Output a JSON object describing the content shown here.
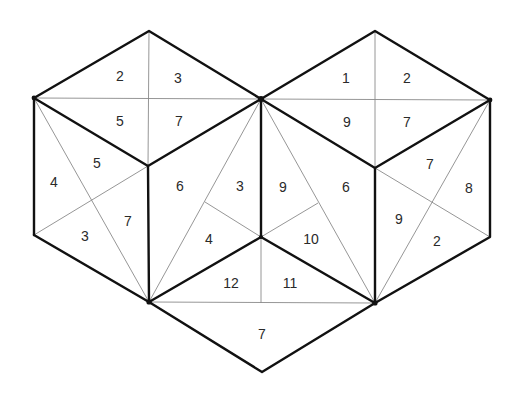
{
  "diagram": {
    "title": "",
    "labels": {
      "left_top_face": [
        "2",
        "3",
        "5",
        "7"
      ],
      "left_front_face": [
        "5",
        "4",
        "7",
        "3"
      ],
      "left_right_face": [
        "6",
        "3",
        "4"
      ],
      "right_top_face": [
        "1",
        "2",
        "9",
        "7"
      ],
      "right_left_face": [
        "9",
        "6",
        "10"
      ],
      "right_front_face": [
        "7",
        "8",
        "9",
        "2"
      ],
      "bottom_center": [
        "12",
        "11"
      ],
      "bottom_rhombus": [
        "7"
      ]
    },
    "regions": [
      {
        "id": "lt-1",
        "label": "2",
        "x": 120,
        "y": 76
      },
      {
        "id": "lt-2",
        "label": "3",
        "x": 178,
        "y": 78
      },
      {
        "id": "lt-3",
        "label": "5",
        "x": 120,
        "y": 121
      },
      {
        "id": "lt-4",
        "label": "7",
        "x": 179,
        "y": 121
      },
      {
        "id": "lf-1",
        "label": "5",
        "x": 97,
        "y": 163
      },
      {
        "id": "lf-2",
        "label": "4",
        "x": 54,
        "y": 182
      },
      {
        "id": "lf-3",
        "label": "7",
        "x": 128,
        "y": 221
      },
      {
        "id": "lf-4",
        "label": "3",
        "x": 85,
        "y": 236
      },
      {
        "id": "mf-1",
        "label": "6",
        "x": 180,
        "y": 186
      },
      {
        "id": "mf-2",
        "label": "3",
        "x": 240,
        "y": 186
      },
      {
        "id": "mf-3",
        "label": "4",
        "x": 209,
        "y": 239
      },
      {
        "id": "rt-1",
        "label": "1",
        "x": 346,
        "y": 78
      },
      {
        "id": "rt-2",
        "label": "2",
        "x": 407,
        "y": 78
      },
      {
        "id": "rt-3",
        "label": "9",
        "x": 347,
        "y": 122
      },
      {
        "id": "rt-4",
        "label": "7",
        "x": 407,
        "y": 122
      },
      {
        "id": "rl-1",
        "label": "9",
        "x": 283,
        "y": 187
      },
      {
        "id": "rl-2",
        "label": "6",
        "x": 346,
        "y": 187
      },
      {
        "id": "rl-3",
        "label": "10",
        "x": 311,
        "y": 239
      },
      {
        "id": "rf-1",
        "label": "7",
        "x": 430,
        "y": 164
      },
      {
        "id": "rf-2",
        "label": "8",
        "x": 469,
        "y": 188
      },
      {
        "id": "rf-3",
        "label": "9",
        "x": 399,
        "y": 219
      },
      {
        "id": "rf-4",
        "label": "2",
        "x": 437,
        "y": 241
      },
      {
        "id": "bc-1",
        "label": "12",
        "x": 231,
        "y": 283
      },
      {
        "id": "bc-2",
        "label": "11",
        "x": 290,
        "y": 283
      },
      {
        "id": "br-1",
        "label": "7",
        "x": 262,
        "y": 334
      }
    ],
    "colors": {
      "thick_line": "#111111",
      "thin_line": "#8a8a8a",
      "text": "#2a2a2a",
      "background": "#ffffff"
    }
  }
}
